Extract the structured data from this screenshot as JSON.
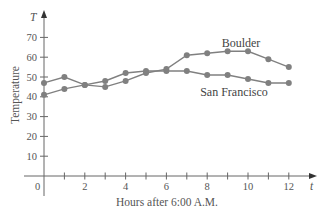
{
  "chart_data": {
    "type": "line",
    "title": "",
    "xlabel": "Hours after 6:00 A.M.",
    "ylabel": "Temperature",
    "x_axis_symbol": "t",
    "y_axis_symbol": "T",
    "x": [
      0,
      1,
      2,
      3,
      4,
      5,
      6,
      7,
      8,
      9,
      10,
      11,
      12
    ],
    "x_ticks": [
      0,
      2,
      4,
      6,
      8,
      10,
      12
    ],
    "x_tick_labels": [
      "0",
      "2",
      "4",
      "6",
      "8",
      "10",
      "12"
    ],
    "y_ticks": [
      10,
      20,
      30,
      40,
      50,
      60,
      70
    ],
    "y_tick_labels": [
      "10",
      "20",
      "30",
      "40",
      "50",
      "60",
      "70"
    ],
    "xlim": [
      0,
      13
    ],
    "ylim": [
      0,
      80
    ],
    "grid": false,
    "legend_position": "inline labels",
    "series": [
      {
        "name": "Boulder",
        "values": [
          47,
          50,
          46,
          45,
          48,
          52,
          54,
          61,
          62,
          63,
          63,
          59,
          55
        ],
        "color": "#808080"
      },
      {
        "name": "San Francisco",
        "values": [
          41,
          44,
          46,
          48,
          52,
          53,
          53,
          53,
          51,
          51,
          49,
          47,
          47
        ],
        "color": "#808080"
      }
    ],
    "annotations": [
      {
        "text": "Boulder",
        "near_x": 9.5,
        "near_y": 67
      },
      {
        "text": "San Francisco",
        "near_x": 9.6,
        "near_y": 43
      }
    ]
  },
  "labels": {
    "x_axis_title": "Hours after 6:00 A.M.",
    "y_axis_title": "Temperature",
    "x_symbol": "t",
    "y_symbol": "T",
    "origin": "0",
    "boulder": "Boulder",
    "san_francisco": "San Francisco"
  }
}
